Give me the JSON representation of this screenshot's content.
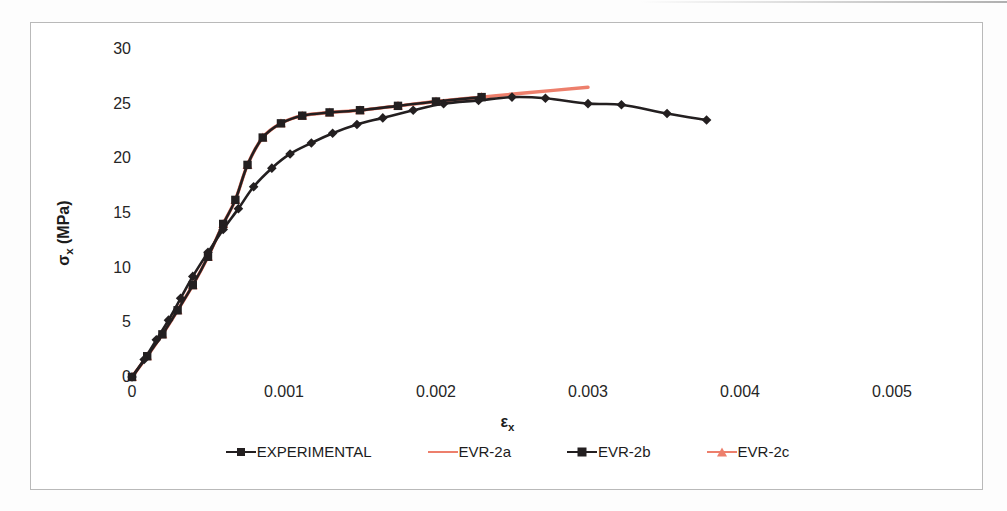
{
  "chart_data": {
    "type": "line",
    "title": "",
    "xlabel": "εx",
    "ylabel": "σx (MPa)",
    "xlabel_base": "ε",
    "xlabel_sub": "x",
    "ylabel_base": "σ",
    "ylabel_sub": "x",
    "ylabel_unit": " (MPa)",
    "xlim": [
      0,
      0.005
    ],
    "ylim": [
      0,
      30
    ],
    "xticks": [
      "0",
      "0.001",
      "0.002",
      "0.003",
      "0.004",
      "0.005"
    ],
    "xtick_values": [
      0,
      0.001,
      0.002,
      0.003,
      0.004,
      0.005
    ],
    "yticks": [
      "0",
      "5",
      "10",
      "15",
      "20",
      "25",
      "30"
    ],
    "ytick_values": [
      0,
      5,
      10,
      15,
      20,
      25,
      30
    ],
    "grid": false,
    "legend_position": "bottom",
    "colors": {
      "experimental": "#231f20",
      "evr_2a": "#ed7f6c",
      "evr_2b": "#231f20",
      "evr_2c": "#ed7f6c"
    },
    "series": [
      {
        "name": "EXPERIMENTAL",
        "marker": "diamond",
        "color": "#231f20",
        "x": [
          0.0,
          8e-05,
          0.00016,
          0.00024,
          0.00032,
          0.0004,
          0.0005,
          0.0006,
          0.0007,
          0.0008,
          0.00092,
          0.00104,
          0.00118,
          0.00132,
          0.00148,
          0.00165,
          0.00185,
          0.00205,
          0.00228,
          0.0025,
          0.00272,
          0.003,
          0.00322,
          0.00352,
          0.00378
        ],
        "y": [
          0.0,
          1.6,
          3.4,
          5.2,
          7.2,
          9.2,
          11.4,
          13.5,
          15.4,
          17.4,
          19.1,
          20.4,
          21.4,
          22.3,
          23.1,
          23.7,
          24.4,
          25.0,
          25.3,
          25.6,
          25.5,
          25.0,
          24.9,
          24.1,
          23.5
        ]
      },
      {
        "name": "EVR-2a",
        "marker": "none",
        "color": "#ed7f6c",
        "x": [
          0.0,
          0.0001,
          0.0002,
          0.0003,
          0.0004,
          0.0005,
          0.0006,
          0.00068,
          0.00076,
          0.00086,
          0.00098,
          0.00112,
          0.0013,
          0.0015,
          0.00175,
          0.002,
          0.0023,
          0.0026,
          0.003
        ],
        "y": [
          0.0,
          1.9,
          3.9,
          6.1,
          8.4,
          11.0,
          14.0,
          16.2,
          19.4,
          21.9,
          23.2,
          23.9,
          24.2,
          24.4,
          24.8,
          25.2,
          25.6,
          26.0,
          26.5
        ]
      },
      {
        "name": "EVR-2b",
        "marker": "square",
        "color": "#231f20",
        "x": [
          0.0,
          0.0001,
          0.0002,
          0.0003,
          0.0004,
          0.0005,
          0.0006,
          0.00068,
          0.00076,
          0.00086,
          0.00098,
          0.00112,
          0.0013,
          0.0015,
          0.00175,
          0.002,
          0.0023
        ],
        "y": [
          0.0,
          1.9,
          3.9,
          6.1,
          8.4,
          11.0,
          14.0,
          16.2,
          19.4,
          21.9,
          23.2,
          23.9,
          24.2,
          24.4,
          24.8,
          25.2,
          25.6
        ]
      },
      {
        "name": "EVR-2c",
        "marker": "triangle",
        "color": "#ed7f6c",
        "x": [
          0.0,
          0.0001,
          0.0002,
          0.0003,
          0.0004,
          0.0005,
          0.0006,
          0.00068,
          0.00076,
          0.00086,
          0.00098,
          0.00112,
          0.0013,
          0.0015,
          0.00175,
          0.002,
          0.0023
        ],
        "y": [
          0.0,
          1.9,
          3.9,
          6.1,
          8.4,
          11.0,
          14.0,
          16.2,
          19.4,
          21.9,
          23.2,
          23.9,
          24.2,
          24.4,
          24.8,
          25.2,
          25.6
        ]
      }
    ],
    "legend": [
      {
        "label": "EXPERIMENTAL",
        "marker": "diamond",
        "color": "#231f20",
        "line_color": "#231f20"
      },
      {
        "label": "EVR-2a",
        "marker": "none",
        "color": "#ed7f6c",
        "line_color": "#ed7f6c"
      },
      {
        "label": "EVR-2b",
        "marker": "square",
        "color": "#231f20",
        "line_color": "#231f20"
      },
      {
        "label": "EVR-2c",
        "marker": "triangle",
        "color": "#ed7f6c",
        "line_color": "#ed7f6c"
      }
    ]
  }
}
